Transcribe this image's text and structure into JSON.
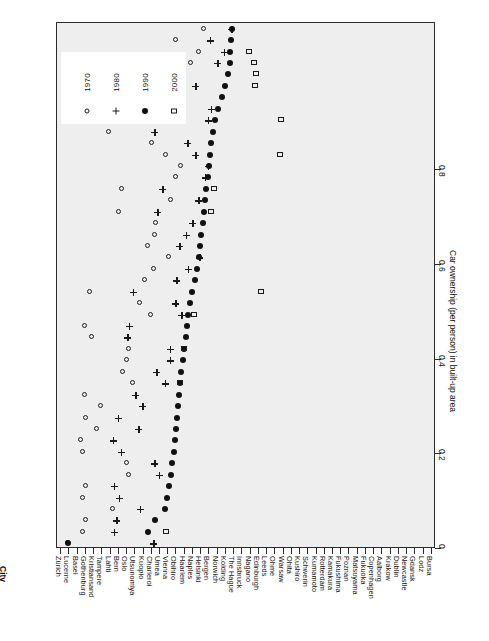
{
  "chart_data": {
    "type": "scatter",
    "title": "",
    "xlabel": "City",
    "ylabel": "Car ownership (per person) in built-up area",
    "value_axis_ticks": [
      "0",
      "0.2",
      "0.4",
      "0.6",
      "0.8"
    ],
    "value_axis_tick_values": [
      0,
      0.2,
      0.4,
      0.6,
      0.8
    ],
    "ylim": [
      0,
      0.8
    ],
    "grid": false,
    "legend_position": "top-left",
    "orientation": "rotated-90",
    "legend": [
      {
        "label": "1970",
        "marker": "open-circle"
      },
      {
        "label": "1980",
        "marker": "plus"
      },
      {
        "label": "1990",
        "marker": "filled-circle"
      },
      {
        "label": "2000",
        "marker": "open-square"
      }
    ],
    "categories": [
      "Bursa",
      "Lodz",
      "Gdansk",
      "Newcastle",
      "Dublin",
      "Krakow",
      "Aalborg",
      "Copenhagen",
      "Fukuoka",
      "Matsuyama",
      "Poznan",
      "Fukushima",
      "Kamakura",
      "Rotterdam",
      "Kumamoto",
      "Schwerin",
      "Kushiro",
      "Ohita",
      "Warsaw",
      "Ohme",
      "Leeds",
      "Edinburgh",
      "Nagano",
      "Innsbruck",
      "The Hague",
      "Kolding",
      "Norwich",
      "Bergen",
      "Helsinki",
      "Naples",
      "Haarlem",
      "Obihiro",
      "Vienna",
      "Umea",
      "Charleroi",
      "Kuopio",
      "Utsunomiya",
      "Oslo",
      "Bern",
      "Lahti",
      "Tampere",
      "Kristiansand",
      "Gothenburg",
      "Basel",
      "Lucerne",
      "Zürich"
    ],
    "series": [
      {
        "name": "1970",
        "marker": "open-circle",
        "values": [
          0.023,
          0.055,
          0.062,
          0.118,
          0.055,
          0.062,
          0.151,
          0.148,
          0.055,
          0.05,
          0.085,
          0.062,
          0.093,
          0.06,
          0.16,
          0.14,
          0.148,
          0.152,
          0.074,
          0.06,
          0.198,
          0.175,
          0.07,
          0.185,
          0.205,
          0.236,
          0.193,
          0.206,
          0.208,
          0.13,
          0.24,
          0.138,
          0.252,
          0.262,
          0.23,
          0.2,
          0.11,
          0.258,
          0.268,
          0.15,
          0.218,
          0.128,
          0.282,
          0.3,
          0.252,
          0.31
        ]
      },
      {
        "name": "1980",
        "marker": "plus",
        "values": [
          0.203,
          0.12,
          0.125,
          0.175,
          0.13,
          0.12,
          0.215,
          0.205,
          0.135,
          0.118,
          0.172,
          0.128,
          0.18,
          0.165,
          0.228,
          0.21,
          0.238,
          0.238,
          0.148,
          0.152,
          0.262,
          0.25,
          0.16,
          0.252,
          0.276,
          0.3,
          0.258,
          0.272,
          0.286,
          0.212,
          0.298,
          0.222,
          0.312,
          0.318,
          0.292,
          0.275,
          0.205,
          0.318,
          0.325,
          0.248,
          0.292,
          0.232,
          0.338,
          0.352,
          0.322,
          0.368
        ]
      },
      {
        "name": "1990",
        "marker": "filled-circle",
        "values": [
          0.023,
          0.192,
          0.206,
          0.228,
          0.232,
          0.236,
          0.24,
          0.243,
          0.247,
          0.25,
          0.252,
          0.254,
          0.256,
          0.258,
          0.26,
          0.262,
          0.265,
          0.268,
          0.272,
          0.274,
          0.277,
          0.28,
          0.286,
          0.292,
          0.296,
          0.3,
          0.302,
          0.305,
          0.308,
          0.31,
          0.312,
          0.315,
          0.318,
          0.32,
          0.323,
          0.326,
          0.33,
          0.334,
          0.34,
          0.348,
          0.355,
          0.362,
          0.365,
          0.366,
          0.368,
          0.37
        ]
      },
      {
        "name": "2000",
        "marker": "open-square",
        "values": [
          null,
          0.23,
          null,
          null,
          null,
          null,
          null,
          null,
          null,
          null,
          null,
          null,
          null,
          null,
          0.26,
          null,
          null,
          0.268,
          null,
          null,
          0.29,
          null,
          0.43,
          null,
          null,
          null,
          null,
          null,
          null,
          0.325,
          null,
          0.332,
          null,
          null,
          0.47,
          null,
          null,
          0.473,
          null,
          null,
          0.418,
          0.42,
          0.415,
          0.405,
          null,
          null
        ]
      }
    ]
  },
  "axes": {
    "category_axis_title": "City",
    "value_axis_title": "Car ownership (per person) in built-up area"
  }
}
